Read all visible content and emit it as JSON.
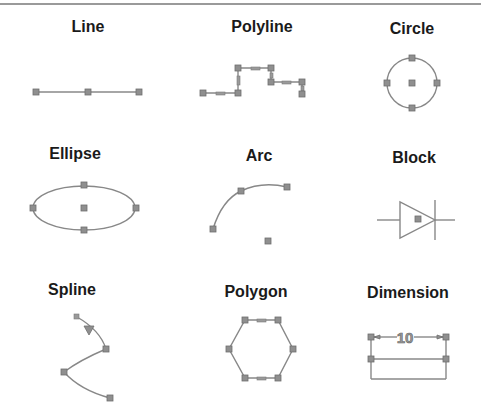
{
  "colors": {
    "stroke": "#888888",
    "grip": "#8f8f8f",
    "label": "#1a1a1a",
    "rule": "#9a9a9a"
  },
  "entities": [
    {
      "label": "Line"
    },
    {
      "label": "Polyline"
    },
    {
      "label": "Circle"
    },
    {
      "label": "Ellipse"
    },
    {
      "label": "Arc"
    },
    {
      "label": "Block"
    },
    {
      "label": "Spline"
    },
    {
      "label": "Polygon"
    },
    {
      "label": "Dimension",
      "dimension_value": "10"
    }
  ]
}
